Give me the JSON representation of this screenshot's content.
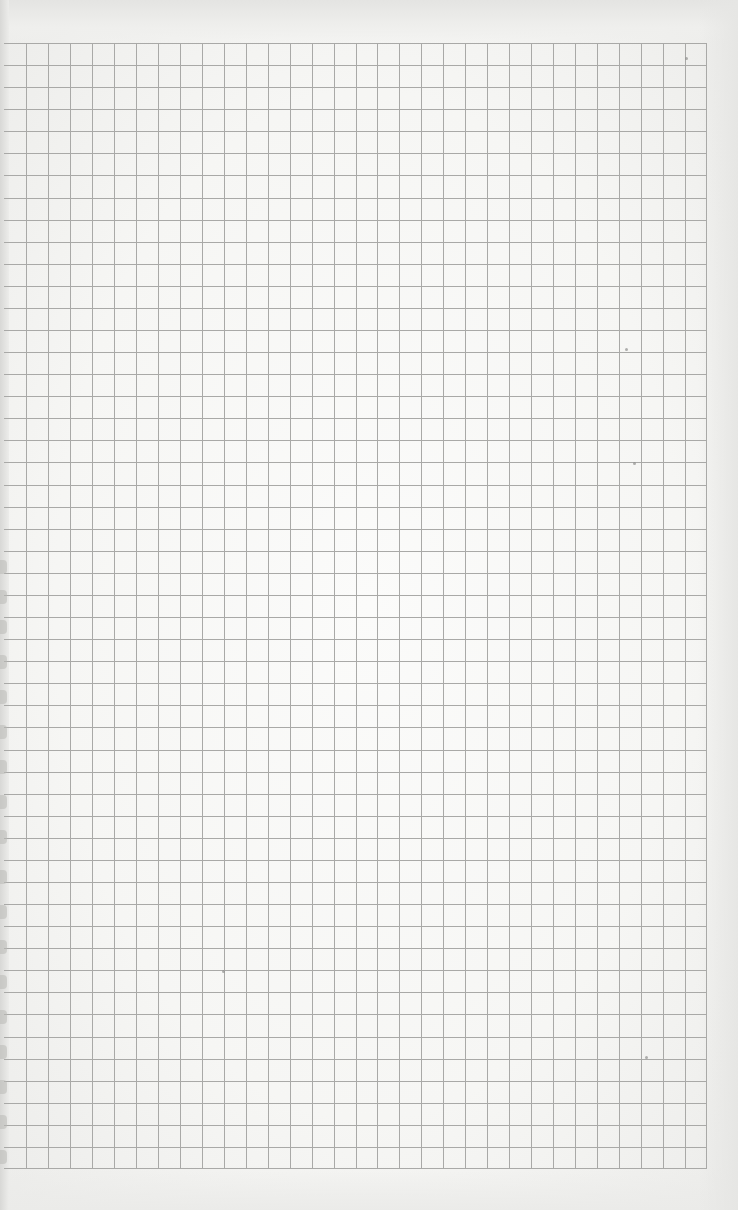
{
  "document": {
    "type": "graph-paper-sheet",
    "text_content": []
  },
  "grid": {
    "left": 4,
    "top": 43,
    "right": 707,
    "bottom": 1169,
    "first_vertical_line_x": 26,
    "cell_size": 22,
    "columns": 32,
    "rows": 51,
    "line_color": "#a9a9a7",
    "paper_color": "#f8f8f6"
  },
  "binding_marks_y": [
    560,
    590,
    620,
    655,
    690,
    725,
    760,
    795,
    830,
    870,
    905,
    940,
    975,
    1010,
    1045,
    1080,
    1115,
    1150
  ],
  "specks": [
    {
      "x": 685,
      "y": 57
    },
    {
      "x": 625,
      "y": 348
    },
    {
      "x": 633,
      "y": 462
    },
    {
      "x": 222,
      "y": 970
    },
    {
      "x": 645,
      "y": 1056
    }
  ]
}
